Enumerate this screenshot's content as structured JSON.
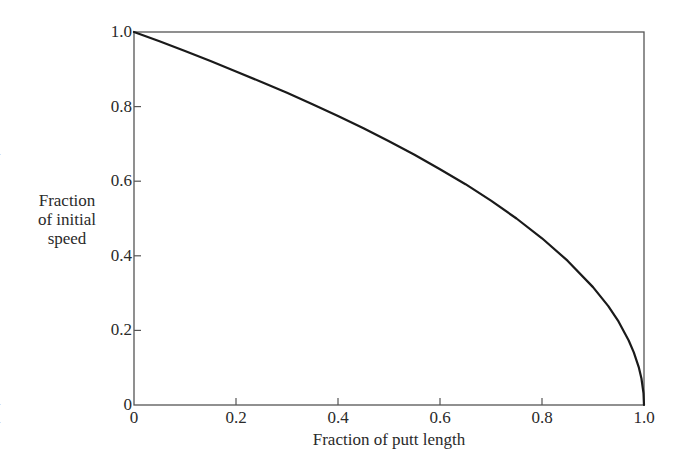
{
  "chart_data": {
    "type": "line",
    "title": "",
    "xlabel": "Fraction of putt length",
    "ylabel": [
      "Fraction",
      "of initial",
      "speed"
    ],
    "xlim": [
      0,
      1.0
    ],
    "ylim": [
      0,
      1.0
    ],
    "x_ticks": [
      0,
      0.2,
      0.4,
      0.6,
      0.8,
      1.0
    ],
    "x_tick_labels": [
      "0",
      "0.2",
      "0.4",
      "0.6",
      "0.8",
      "1.0"
    ],
    "y_ticks": [
      0,
      0.2,
      0.4,
      0.6,
      0.8,
      1.0
    ],
    "y_tick_labels": [
      "0",
      "0.2",
      "0.4",
      "0.6",
      "0.8",
      "1.0"
    ],
    "grid": false,
    "legend": null,
    "frame": "box",
    "series": [
      {
        "name": "Fraction of initial speed",
        "formula": "sqrt(1 - x)",
        "x": [
          0,
          0.05,
          0.1,
          0.15,
          0.2,
          0.25,
          0.3,
          0.35,
          0.4,
          0.45,
          0.5,
          0.55,
          0.6,
          0.65,
          0.7,
          0.75,
          0.8,
          0.85,
          0.9,
          0.93,
          0.95,
          0.97,
          0.98,
          0.99,
          0.995,
          0.999,
          1.0
        ],
        "values": [
          1.0,
          0.975,
          0.949,
          0.922,
          0.894,
          0.866,
          0.837,
          0.806,
          0.775,
          0.742,
          0.707,
          0.671,
          0.632,
          0.592,
          0.548,
          0.5,
          0.447,
          0.387,
          0.316,
          0.265,
          0.224,
          0.173,
          0.141,
          0.1,
          0.071,
          0.032,
          0.0
        ]
      }
    ]
  },
  "edge_fragments": [
    "l",
    "l",
    "l"
  ]
}
